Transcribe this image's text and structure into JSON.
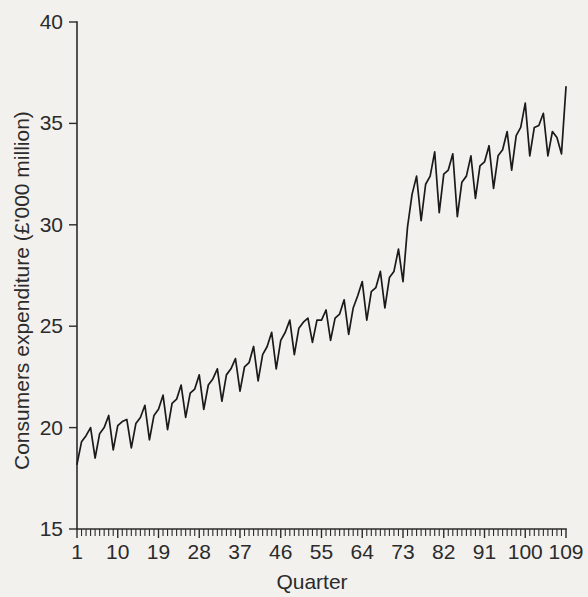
{
  "chart_data": {
    "type": "line",
    "title": "",
    "xlabel": "Quarter",
    "ylabel": "Consumers expenditure (£'000 million)",
    "xlim": [
      1,
      109
    ],
    "ylim": [
      15,
      40
    ],
    "grid": false,
    "legend": "none",
    "y_ticks": [
      15,
      20,
      25,
      30,
      35,
      40
    ],
    "y_tick_labels": [
      "15",
      "20",
      "25",
      "30",
      "35",
      "40"
    ],
    "x_ticks": [
      1,
      10,
      19,
      28,
      37,
      46,
      55,
      64,
      73,
      82,
      91,
      100,
      109
    ],
    "x_tick_labels": [
      "1",
      "10",
      "19",
      "28",
      "37",
      "46",
      "55",
      "64",
      "73",
      "82",
      "91",
      "100",
      "109"
    ],
    "x_minor_tick_step": 1,
    "series_name": "Consumers expenditure",
    "line_color": "#1a1a1a",
    "background_color": "#f2f1ee",
    "n_points": 109,
    "x": [
      1,
      2,
      3,
      4,
      5,
      6,
      7,
      8,
      9,
      10,
      11,
      12,
      13,
      14,
      15,
      16,
      17,
      18,
      19,
      20,
      21,
      22,
      23,
      24,
      25,
      26,
      27,
      28,
      29,
      30,
      31,
      32,
      33,
      34,
      35,
      36,
      37,
      38,
      39,
      40,
      41,
      42,
      43,
      44,
      45,
      46,
      47,
      48,
      49,
      50,
      51,
      52,
      53,
      54,
      55,
      56,
      57,
      58,
      59,
      60,
      61,
      62,
      63,
      64,
      65,
      66,
      67,
      68,
      69,
      70,
      71,
      72,
      73,
      74,
      75,
      76,
      77,
      78,
      79,
      80,
      81,
      82,
      83,
      84,
      85,
      86,
      87,
      88,
      89,
      90,
      91,
      92,
      93,
      94,
      95,
      96,
      97,
      98,
      99,
      100,
      101,
      102,
      103,
      104,
      105,
      106,
      107,
      108,
      109
    ],
    "values": [
      18.2,
      19.3,
      19.6,
      20.0,
      18.5,
      19.7,
      20.0,
      20.6,
      18.9,
      20.1,
      20.3,
      20.4,
      19.0,
      20.2,
      20.5,
      21.1,
      19.4,
      20.6,
      20.9,
      21.6,
      19.9,
      21.2,
      21.4,
      22.1,
      20.5,
      21.7,
      21.9,
      22.6,
      20.9,
      22.1,
      22.4,
      22.9,
      21.3,
      22.6,
      22.9,
      23.4,
      21.8,
      23.0,
      23.2,
      24.0,
      22.3,
      23.6,
      24.0,
      24.7,
      22.9,
      24.3,
      24.7,
      25.3,
      23.6,
      24.9,
      25.2,
      25.4,
      24.2,
      25.3,
      25.3,
      25.8,
      24.3,
      25.4,
      25.6,
      26.3,
      24.6,
      25.9,
      26.5,
      27.2,
      25.3,
      26.7,
      26.9,
      27.7,
      25.9,
      27.4,
      27.7,
      28.8,
      27.2,
      29.9,
      31.5,
      32.4,
      30.2,
      32.0,
      32.4,
      33.6,
      30.6,
      32.5,
      32.7,
      33.5,
      30.4,
      32.1,
      32.4,
      33.4,
      31.3,
      32.9,
      33.1,
      33.9,
      31.8,
      33.4,
      33.7,
      34.6,
      32.7,
      34.4,
      34.8,
      36.0,
      33.4,
      34.8,
      34.9,
      35.5,
      33.4,
      34.6,
      34.3,
      33.5,
      36.8
    ]
  },
  "axis": {
    "y_title": "Consumers expenditure (£'000 million)",
    "x_title": "Quarter"
  }
}
